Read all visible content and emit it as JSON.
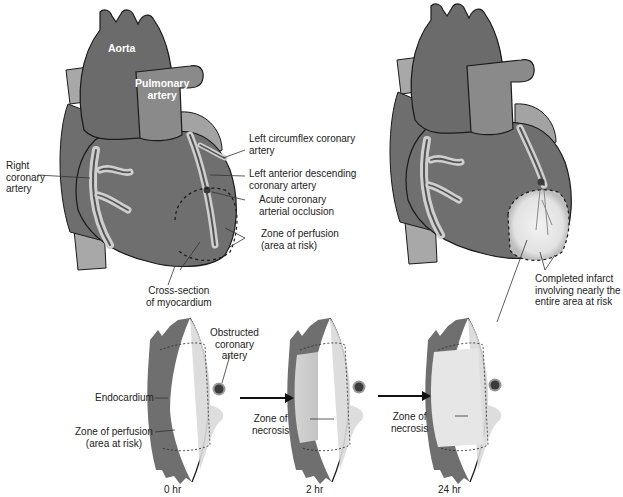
{
  "colors": {
    "myocardium": "#6f6f6f",
    "vessel_dark": "#767676",
    "vessel_light": "#9a9a9a",
    "pale_fat": "#cfcfcf",
    "epicardium": "#d9d9d9",
    "necrosis": "#e4e4e4",
    "outline": "#1a1a1a",
    "text": "#222222"
  },
  "heart_left": {
    "labels": {
      "aorta": "Aorta",
      "pulmonary_artery": [
        "Pulmonary",
        "artery"
      ],
      "right_coronary_artery": [
        "Right",
        "coronary",
        "artery"
      ],
      "left_circumflex": [
        "Left circumflex coronary",
        "artery"
      ],
      "left_anterior_descending": [
        "Left anterior descending",
        "coronary artery"
      ],
      "acute_occlusion": [
        "Acute coronary",
        "arterial occlusion"
      ],
      "zone_of_perfusion": [
        "Zone of perfusion",
        "(area at risk)"
      ]
    }
  },
  "heart_right": {
    "labels": {
      "completed_infarct": [
        "Completed infarct",
        "involving nearly the",
        "entire area at risk"
      ]
    }
  },
  "cross_sections": {
    "title": [
      "Cross-section",
      "of myocardium"
    ],
    "obstructed_artery": [
      "Obstructed",
      "coronary",
      "artery"
    ],
    "endocardium": "Endocardium",
    "zone_of_perfusion": [
      "Zone of perfusion",
      "(area at risk)"
    ],
    "stages": [
      {
        "time": "0 hr"
      },
      {
        "time": "2 hr",
        "label": [
          "Zone of",
          "necrosis"
        ]
      },
      {
        "time": "24 hr",
        "label": [
          "Zone of",
          "necrosis"
        ]
      }
    ]
  }
}
